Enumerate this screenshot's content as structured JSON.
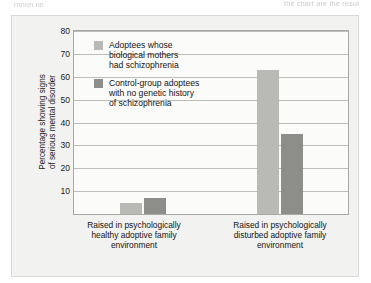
{
  "page_fragments": {
    "left": "rnnnn nn",
    "right": "the chart are the resul"
  },
  "chart_data": {
    "type": "bar",
    "title": "",
    "xlabel": "",
    "ylabel": "Percentage showing signs\nof serious mental disorder",
    "ylim": [
      0,
      80
    ],
    "yticks": [
      10,
      20,
      30,
      40,
      50,
      60,
      70,
      80
    ],
    "ytick_labels": [
      "10",
      "20",
      "30",
      "40",
      "50",
      "60",
      "70",
      "80"
    ],
    "grid": true,
    "legend_position": "inside-top-left",
    "categories": [
      "Raised in psychologically\nhealthy adoptive family\nenvironment",
      "Raised in psychologically\ndisturbed adoptive family\nenvironment"
    ],
    "series": [
      {
        "name": "Adoptees whose\nbiological mothers\nhad schizophrenia",
        "color": "#b9b9b5",
        "values": [
          5,
          63
        ]
      },
      {
        "name": "Control-group adoptees\nwith no genetic history\nof schizophrenia",
        "color": "#8d8d89",
        "values": [
          7,
          35
        ]
      }
    ]
  }
}
